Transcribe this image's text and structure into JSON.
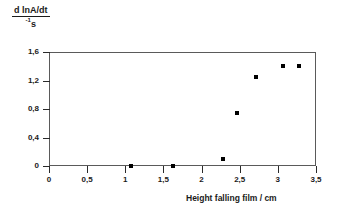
{
  "chart_data": {
    "type": "scatter",
    "title": "",
    "xlabel": "Height falling film / cm",
    "ylabel_numerator": "d lnA/dt",
    "ylabel_denominator": "s",
    "ylabel_denominator_exponent": "-1",
    "xlim": [
      0,
      3.5
    ],
    "ylim": [
      0,
      1.6
    ],
    "grid": false,
    "legend": null,
    "xticks": [
      "0",
      "0,5",
      "1",
      "1,5",
      "2",
      "2,5",
      "3",
      "3,5"
    ],
    "xtick_values": [
      0,
      0.5,
      1,
      1.5,
      2,
      2.5,
      3,
      3.5
    ],
    "yticks": [
      "0",
      "0,4",
      "0,8",
      "1,2",
      "1,6"
    ],
    "ytick_values": [
      0,
      0.4,
      0.8,
      1.2,
      1.6
    ],
    "x": [
      1.07,
      1.62,
      2.28,
      2.47,
      2.72,
      3.07,
      3.28
    ],
    "y": [
      0.0,
      0.0,
      0.1,
      0.75,
      1.25,
      1.4,
      1.4
    ],
    "points": [
      {
        "x": 1.07,
        "y": 0.0
      },
      {
        "x": 1.62,
        "y": 0.0
      },
      {
        "x": 2.28,
        "y": 0.1
      },
      {
        "x": 2.47,
        "y": 0.75
      },
      {
        "x": 2.72,
        "y": 1.25
      },
      {
        "x": 3.07,
        "y": 1.4
      },
      {
        "x": 3.28,
        "y": 1.4
      }
    ],
    "marker": "square",
    "marker_color": "#000000",
    "axis_color": "#5a5a5a",
    "background": "#ffffff"
  }
}
